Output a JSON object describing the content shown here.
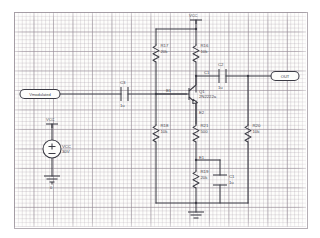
{
  "sheet": {
    "background": "#fdfdfb",
    "grid_color": "#968c96",
    "ink_color": "#3b3b44"
  },
  "ports": {
    "input": {
      "name": "input-port",
      "label": "Vmodulated"
    },
    "output": {
      "name": "output-port",
      "label": "OUT"
    }
  },
  "power": {
    "rail_label": "VCC",
    "source_ref": "VCC",
    "source_value": "30V",
    "ground_label": "0"
  },
  "transistor": {
    "ref": "Q1",
    "part": "2N2222a",
    "type": "npn"
  },
  "resistors": [
    {
      "ref": "R17",
      "value": "20k"
    },
    {
      "ref": "R16",
      "value": "10k"
    },
    {
      "ref": "R18",
      "value": "10k"
    },
    {
      "ref": "R21",
      "value": "500"
    },
    {
      "ref": "R20",
      "value": "10k"
    },
    {
      "ref": "R19",
      "value": "20k"
    }
  ],
  "capacitors": [
    {
      "ref": "C3",
      "value": "1u"
    },
    {
      "ref": "C2",
      "value": "1u"
    },
    {
      "ref": "C1",
      "value": "1u"
    }
  ],
  "net_labels": [
    {
      "ref": "B1"
    },
    {
      "ref": "C1"
    },
    {
      "ref": "E1"
    },
    {
      "ref": "E2"
    }
  ]
}
